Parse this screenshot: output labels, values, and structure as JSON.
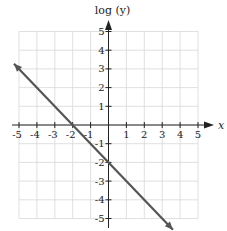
{
  "chart_data": {
    "type": "line",
    "title": "",
    "xlabel": "x",
    "ylabel": "log (y)",
    "xlim": [
      -5,
      5
    ],
    "ylim": [
      -5,
      5
    ],
    "grid": true,
    "x_ticks": [
      "-5",
      "-4",
      "-3",
      "-2",
      "-1",
      "1",
      "2",
      "3",
      "4",
      "5"
    ],
    "y_ticks": [
      "5",
      "4",
      "3",
      "2",
      "1",
      "-1",
      "-2",
      "-3",
      "-4",
      "-5"
    ],
    "series": [
      {
        "name": "log(y) = -x - 2",
        "equation": "log(y) = -x - 2",
        "slope": -1,
        "intercept": -2,
        "x": [
          -5.28,
          -2,
          0,
          3.6
        ],
        "y": [
          3.28,
          0,
          -2,
          -5.6
        ],
        "arrows_both_ends": true,
        "color": "#555555"
      }
    ],
    "legend": null
  },
  "colors": {
    "grid": "#d8d8d8",
    "axis": "#222222",
    "line": "#555555"
  }
}
